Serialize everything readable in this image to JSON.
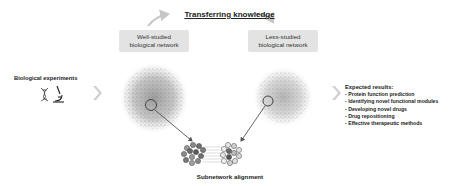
{
  "header": {
    "title": "Transferring knowledge"
  },
  "networks": {
    "left": {
      "label_line1": "Well-studied",
      "label_line2": "biological network"
    },
    "right": {
      "label_line1": "Less-studied",
      "label_line2": "biological network"
    }
  },
  "input": {
    "label": "Biological experiments",
    "icons": [
      "dna-icon",
      "microscope-icon"
    ]
  },
  "output": {
    "heading": "Expected results:",
    "items": [
      "- Protein function prediction",
      "- Identifying novel functional modules",
      "- Developing novel drugs",
      "- Drug repositioning",
      "- Effective therapeutic methods"
    ]
  },
  "alignment": {
    "label": "Subnetwork alignment"
  },
  "colors": {
    "box_fill": "#e3e3e3",
    "arrow_gray": "#c8c8c8",
    "network_gray": "#8a8a8a",
    "alignment_dark_nodes": "#6e6e6e",
    "alignment_light_nodes": "#d9d9d9"
  }
}
